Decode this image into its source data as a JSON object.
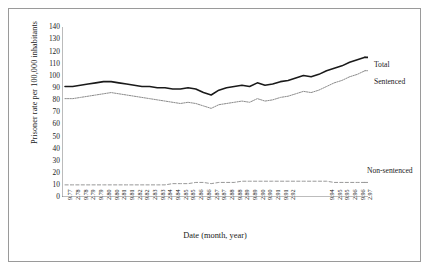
{
  "chart_data": {
    "type": "line",
    "title": "",
    "xlabel": "Date (month, year)",
    "ylabel": "Prisoner rate per 100,000 inhabitants",
    "ylim": [
      0,
      140
    ],
    "yticks": [
      0,
      10,
      20,
      30,
      40,
      50,
      60,
      70,
      80,
      90,
      100,
      110,
      120,
      130,
      140
    ],
    "grid": false,
    "legend_position": "inline-right",
    "categories": [
      "9.77",
      "2.78",
      "9.78",
      "2.79",
      "9.79",
      "2.80",
      "9.80",
      "2.81",
      "9.81",
      "2.82",
      "9.82",
      "2.83",
      "9.83",
      "2.84",
      "9.84",
      "2.85",
      "9.85",
      "2.86",
      "9.86",
      "2.87",
      "9.87",
      "2.88",
      "9.88",
      "2.89",
      "9.89",
      "2.90",
      "9.90",
      "2.91",
      "9.91",
      "2.92",
      "9.92",
      "2.93",
      "9.93",
      "2.94",
      "9.94",
      "2.95",
      "9.95",
      "2.96",
      "9.96",
      "2.97"
    ],
    "x_tick_labels_shown": [
      "9.77",
      "2.78",
      "9.78",
      "2.79",
      "9.79",
      "2.80",
      "9.80",
      "2.81",
      "9.81",
      "2.82",
      "9.82",
      "2.83",
      "9.83",
      "2.84",
      "9.84",
      "2.85",
      "9.85",
      "2.86",
      "9.86",
      "2.87",
      "9.87",
      "2.88",
      "9.88",
      "2.89",
      "9.89",
      "2.90",
      "9.90",
      "2.91",
      "9.91",
      "2.92",
      "9.94",
      "2.95",
      "9.95",
      "2.96",
      "9.96",
      "2.97"
    ],
    "series": [
      {
        "name": "Total",
        "style": "solid-thick",
        "color": "#1a1a1a",
        "values": [
          91,
          91,
          92,
          93,
          94,
          95,
          95,
          94,
          93,
          92,
          91,
          91,
          90,
          90,
          89,
          89,
          90,
          89,
          86,
          84,
          88,
          90,
          91,
          92,
          91,
          94,
          92,
          93,
          95,
          96,
          98,
          100,
          99,
          101,
          104,
          106,
          108,
          111,
          113,
          115
        ]
      },
      {
        "name": "Sentenced",
        "style": "dotted",
        "color": "#8c8c8c",
        "values": [
          81,
          81,
          82,
          83,
          84,
          85,
          86,
          85,
          84,
          83,
          82,
          81,
          80,
          79,
          78,
          77,
          78,
          77,
          75,
          73,
          76,
          77,
          78,
          79,
          78,
          81,
          79,
          80,
          82,
          83,
          85,
          87,
          86,
          88,
          91,
          94,
          96,
          99,
          101,
          104
        ]
      },
      {
        "name": "Non-sentenced",
        "style": "dashed",
        "color": "#8c8c8c",
        "values": [
          10,
          10,
          10,
          10,
          10,
          10,
          10,
          10,
          10,
          10,
          10,
          10,
          10,
          10,
          11,
          11,
          11,
          12,
          12,
          11,
          12,
          12,
          12,
          13,
          13,
          13,
          13,
          13,
          13,
          13,
          13,
          13,
          13,
          13,
          13,
          12,
          12,
          12,
          12,
          12
        ]
      }
    ]
  },
  "labels": {
    "total": "Total",
    "sentenced": "Sentenced",
    "non_sentenced": "Non-sentenced"
  }
}
